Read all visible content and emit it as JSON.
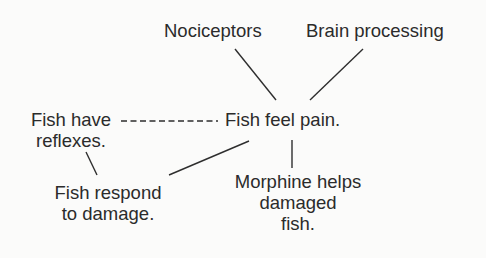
{
  "diagram": {
    "type": "concept-map",
    "central_node": {
      "id": "feel_pain",
      "lines": [
        "Fish feel pain."
      ]
    },
    "nodes": [
      {
        "id": "nociceptors",
        "lines": [
          "Nociceptors"
        ]
      },
      {
        "id": "brain",
        "lines": [
          "Brain processing"
        ]
      },
      {
        "id": "reflexes",
        "lines": [
          "Fish have",
          "reflexes."
        ]
      },
      {
        "id": "feel_pain",
        "lines": [
          "Fish feel pain."
        ]
      },
      {
        "id": "respond",
        "lines": [
          "Fish respond",
          "to damage."
        ]
      },
      {
        "id": "morphine",
        "lines": [
          "Morphine helps",
          "damaged",
          "fish."
        ]
      }
    ],
    "edges": [
      {
        "from": "nociceptors",
        "to": "feel_pain",
        "style": "solid"
      },
      {
        "from": "brain",
        "to": "feel_pain",
        "style": "solid"
      },
      {
        "from": "reflexes",
        "to": "feel_pain",
        "style": "dashed"
      },
      {
        "from": "reflexes",
        "to": "respond",
        "style": "solid"
      },
      {
        "from": "feel_pain",
        "to": "respond",
        "style": "solid"
      },
      {
        "from": "feel_pain",
        "to": "morphine",
        "style": "solid"
      }
    ]
  }
}
